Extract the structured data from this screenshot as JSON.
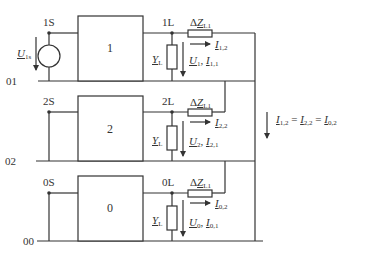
{
  "colors": {
    "line": "#333333",
    "background": "#ffffff"
  },
  "networks": [
    {
      "id": "1",
      "box_label": "1",
      "source_node": "1S",
      "load_node": "1L",
      "reference_node": "01",
      "source_voltage": {
        "sym": "U",
        "sub": "1s"
      },
      "admittance": {
        "sym": "Y",
        "sub": "L"
      },
      "impedance": {
        "prefix": "Δ",
        "sym": "Z",
        "sub": "L1"
      },
      "branch_current": {
        "sym": "I",
        "sub": "1,2"
      },
      "voltage_current": {
        "v_sym": "U",
        "v_sub": "1",
        "sep": ", ",
        "i_sym": "I",
        "i_sub": "1,1"
      }
    },
    {
      "id": "2",
      "box_label": "2",
      "source_node": "2S",
      "load_node": "2L",
      "reference_node": "02",
      "admittance": {
        "sym": "Y",
        "sub": "L"
      },
      "impedance": {
        "prefix": "Δ",
        "sym": "Z",
        "sub": "L1"
      },
      "branch_current": {
        "sym": "I",
        "sub": "2,2"
      },
      "voltage_current": {
        "v_sym": "U",
        "v_sub": "2",
        "sep": ", ",
        "i_sym": "I",
        "i_sub": "2,1"
      }
    },
    {
      "id": "0",
      "box_label": "0",
      "source_node": "0S",
      "load_node": "0L",
      "reference_node": "00",
      "admittance": {
        "sym": "Y",
        "sub": "L"
      },
      "impedance": {
        "prefix": "Δ",
        "sym": "Z",
        "sub": "L1"
      },
      "branch_current": {
        "sym": "I",
        "sub": "0,2"
      },
      "voltage_current": {
        "v_sym": "U",
        "v_sub": "0",
        "sep": ", ",
        "i_sym": "I",
        "i_sub": "0,1"
      }
    }
  ],
  "equation": {
    "a_sym": "I",
    "a_sub": "1,2",
    "eq1": " = ",
    "b_sym": "I",
    "b_sub": "2,2",
    "eq2": " = ",
    "c_sym": "I",
    "c_sub": "0,2"
  }
}
